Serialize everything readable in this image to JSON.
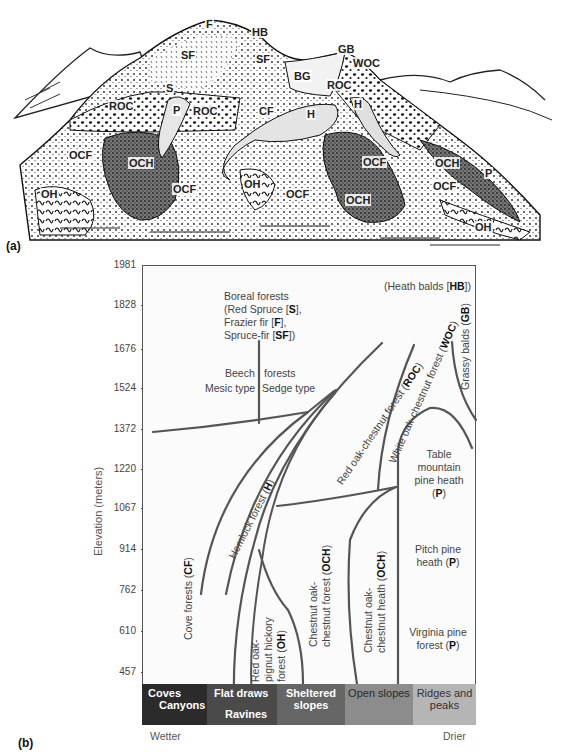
{
  "panel_a": {
    "tag": "(a)",
    "labels": [
      {
        "text": "F",
        "x": 205,
        "y": 24
      },
      {
        "text": "HB",
        "x": 251,
        "y": 30
      },
      {
        "text": "SF",
        "x": 180,
        "y": 53
      },
      {
        "text": "SF",
        "x": 255,
        "y": 57
      },
      {
        "text": "GB",
        "x": 337,
        "y": 47
      },
      {
        "text": "WOC",
        "x": 352,
        "y": 61
      },
      {
        "text": "BG",
        "x": 293,
        "y": 72
      },
      {
        "text": "S",
        "x": 165,
        "y": 84
      },
      {
        "text": "ROC",
        "x": 326,
        "y": 83
      },
      {
        "text": "ROC",
        "x": 108,
        "y": 103
      },
      {
        "text": "P",
        "x": 172,
        "y": 106
      },
      {
        "text": "ROC",
        "x": 192,
        "y": 107
      },
      {
        "text": "CF",
        "x": 258,
        "y": 107
      },
      {
        "text": "H",
        "x": 306,
        "y": 110
      },
      {
        "text": "H",
        "x": 353,
        "y": 100
      },
      {
        "text": "OCF",
        "x": 68,
        "y": 151
      },
      {
        "text": "OCH",
        "x": 128,
        "y": 158
      },
      {
        "text": "OCF",
        "x": 362,
        "y": 158
      },
      {
        "text": "OCH",
        "x": 434,
        "y": 158
      },
      {
        "text": "P",
        "x": 484,
        "y": 168
      },
      {
        "text": "OCF",
        "x": 172,
        "y": 184
      },
      {
        "text": "OH",
        "x": 243,
        "y": 179
      },
      {
        "text": "OCF",
        "x": 432,
        "y": 181
      },
      {
        "text": "OH",
        "x": 40,
        "y": 189
      },
      {
        "text": "OCF",
        "x": 285,
        "y": 189
      },
      {
        "text": "OCH",
        "x": 345,
        "y": 195
      },
      {
        "text": "OH",
        "x": 474,
        "y": 221
      }
    ]
  },
  "panel_b": {
    "tag": "(b)",
    "y_axis_label": "Elevation (meters)",
    "y_ticks": [
      "1981",
      "1828",
      "1676",
      "1524",
      "1372",
      "1220",
      "1067",
      "914",
      "762",
      "610",
      "457"
    ],
    "annotations": {
      "boreal": [
        "Boreal forests",
        "(Red Spruce [",
        "S",
        "],",
        "Frazier fir [",
        "F",
        "],",
        "Spruce-fir [",
        "SF",
        "])"
      ],
      "heath_balds": [
        "(Heath balds [",
        "HB",
        "])"
      ],
      "beech_title_left": "Beech",
      "beech_title_right": "forests",
      "beech_mesic": "Mesic type",
      "beech_sedge": "Sedge type",
      "table_mountain": [
        "Table",
        "mountain",
        "pine heath",
        "(",
        "P",
        ")"
      ],
      "pitch_pine": [
        "Pitch pine",
        "heath (",
        "P",
        ")"
      ],
      "virginia_pine": [
        "Virginia pine",
        "forest (",
        "P",
        ")"
      ],
      "grassy_balds": [
        "Grassy balds (",
        "GB",
        ")"
      ],
      "white_oak": [
        "White oak-chestnut forest (",
        "WOC",
        ")"
      ],
      "red_oak": [
        "Red oak-chestnut forest (",
        "ROC",
        ")"
      ],
      "hemlock": [
        "Hemlock forest (",
        "H",
        ")"
      ],
      "cove": [
        "Cove forests (",
        "CF",
        ")"
      ],
      "red_oak_hickory": [
        "Red oak-",
        "pignut hickory",
        "forest (",
        "OH",
        ")"
      ],
      "chestnut_oak_forest": [
        "Chestnut oak-",
        "chestnut forest (",
        "OCH",
        ")"
      ],
      "chestnut_oak_heath": [
        "Chestnut oak-",
        "chestnut heath (",
        "OCH",
        ")"
      ]
    },
    "habitat_bar": [
      {
        "line1": "Coves",
        "line2": "Canyons",
        "color": "#2b2b2b",
        "text_color": "#ffffff"
      },
      {
        "line1": "Flat draws",
        "line2": "Ravines",
        "color": "#4a4a4a",
        "text_color": "#ffffff"
      },
      {
        "line1": "Sheltered",
        "line2": "slopes",
        "color": "#666666",
        "text_color": "#ffffff"
      },
      {
        "line1": "Open slopes",
        "line2": "",
        "color": "#8c8c8c",
        "text_color": "#2a2a2a"
      },
      {
        "line1": "Ridges and",
        "line2": "peaks",
        "color": "#b5b5b5",
        "text_color": "#333333"
      }
    ],
    "gradient_left": "Wetter",
    "gradient_right": "Drier",
    "line_color": "#555555"
  }
}
